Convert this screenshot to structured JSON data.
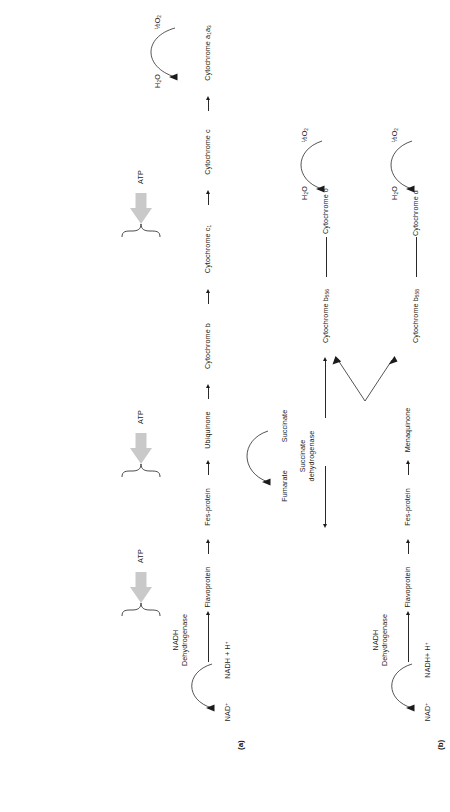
{
  "figure": {
    "panels": [
      {
        "tag": "(a)",
        "substrate_pair": {
          "product": "NAD+",
          "reactant": "NADH + H+"
        },
        "enzyme": "NADH\nDehydrogenase",
        "carriers": [
          "Flavoprotein",
          "Fes-protein",
          "Ubiquinone",
          "Cytochrome b",
          "Cytochrome c1",
          "Cytochrome c",
          "Cytochrome a·a3"
        ],
        "terminal": {
          "product": "H2O",
          "reactant": "1/2 O2"
        },
        "atp_sites": [
          "ATP",
          "ATP",
          "ATP"
        ],
        "atp_count": 3
      },
      {
        "tag": "(b)",
        "substrate_pair": {
          "product": "NAD+",
          "reactant": "NADH+ H+"
        },
        "enzyme": "NADH\nDehydrogenase",
        "carriers": [
          "Flavoprotein",
          "Fes-protein",
          "Menaquinone"
        ],
        "branches": [
          {
            "carriers": [
              "Cytochrome b556",
              "Cytochrome o"
            ],
            "terminal": {
              "product": "H2O",
              "reactant": "1/2 O2"
            }
          },
          {
            "carriers": [
              "Cytochrome b558",
              "Cytochrome d"
            ],
            "terminal": {
              "product": "H2O",
              "reactant": "1/2 O2"
            }
          }
        ]
      }
    ],
    "shared": {
      "enzyme": "Succinate\ndehydrogenase",
      "pair": {
        "product": "Fumarate",
        "reactant": "Succinate"
      }
    },
    "colors": {
      "ink": "#1b1b1b",
      "line": "#2a2a2a",
      "atp_arrow": "#c9c9c9",
      "background": "#ffffff"
    }
  }
}
